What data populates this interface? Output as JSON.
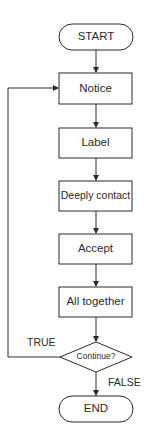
{
  "diagram": {
    "type": "flowchart",
    "nodes": [
      {
        "id": "start",
        "shape": "terminator",
        "label": "START"
      },
      {
        "id": "notice",
        "shape": "process",
        "label": "Notice"
      },
      {
        "id": "label",
        "shape": "process",
        "label": "Label"
      },
      {
        "id": "deeply_contact",
        "shape": "process",
        "label": "Deeply contact"
      },
      {
        "id": "accept",
        "shape": "process",
        "label": "Accept"
      },
      {
        "id": "all_together",
        "shape": "process",
        "label": "All together"
      },
      {
        "id": "continue",
        "shape": "decision",
        "label": "Continue?"
      },
      {
        "id": "end",
        "shape": "terminator",
        "label": "END"
      }
    ],
    "edges": [
      {
        "from": "start",
        "to": "notice"
      },
      {
        "from": "notice",
        "to": "label"
      },
      {
        "from": "label",
        "to": "deeply_contact"
      },
      {
        "from": "deeply_contact",
        "to": "accept"
      },
      {
        "from": "accept",
        "to": "all_together"
      },
      {
        "from": "all_together",
        "to": "continue"
      },
      {
        "from": "continue",
        "to": "notice",
        "label": "TRUE"
      },
      {
        "from": "continue",
        "to": "end",
        "label": "FALSE"
      }
    ],
    "edge_labels": {
      "true": "TRUE",
      "false": "FALSE"
    },
    "colors": {
      "stroke": "#2a2a2a",
      "fill": "#ffffff",
      "text": "#2a2a2a"
    }
  }
}
